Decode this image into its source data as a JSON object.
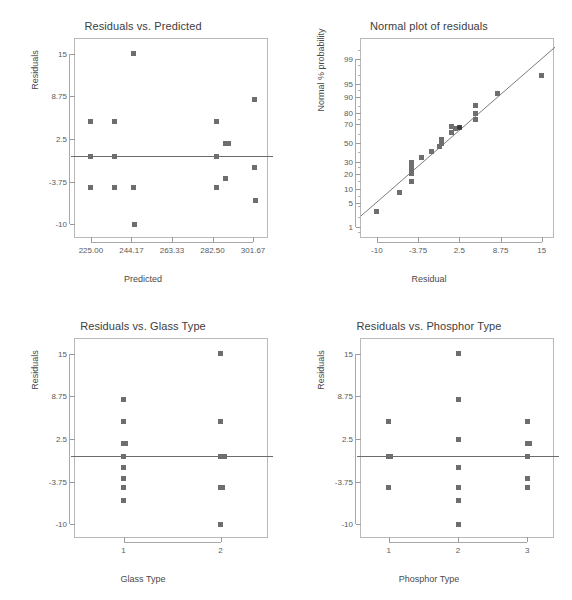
{
  "figure": {
    "marker_color": "#6e6e6e",
    "line_color": "#6b6b6b",
    "frame_color": "#b9b9b9",
    "background": "#ffffff"
  },
  "panels": [
    {
      "id": "residuals-vs-predicted",
      "title": "Residuals vs. Predicted",
      "xlabel": "Predicted",
      "ylabel": "Residuals",
      "xticks": [
        "225.00",
        "244.17",
        "263.33",
        "282.50",
        "301.67"
      ],
      "yticks": [
        "15",
        "8.75",
        "2.5",
        "-3.75",
        "-10"
      ]
    },
    {
      "id": "normal-plot-of-residuals",
      "title": "Normal plot of residuals",
      "xlabel": "Residual",
      "ylabel": "Normal % probability",
      "xticks": [
        "-10",
        "-3.75",
        "2.5",
        "8.75",
        "15"
      ],
      "yticks": [
        "99",
        "95",
        "90",
        "80",
        "70",
        "50",
        "30",
        "20",
        "10",
        "5",
        "1"
      ]
    },
    {
      "id": "residuals-vs-glass-type",
      "title": "Residuals vs. Glass Type",
      "xlabel": "Glass Type",
      "ylabel": "Residuals",
      "xticks": [
        "1",
        "2"
      ],
      "yticks": [
        "15",
        "8.75",
        "2.5",
        "-3.75",
        "-10"
      ]
    },
    {
      "id": "residuals-vs-phosphor-type",
      "title": "Residuals vs. Phosphor Type",
      "xlabel": "Phosphor Type",
      "ylabel": "Residuals",
      "xticks": [
        "1",
        "2",
        "3"
      ],
      "yticks": [
        "15",
        "8.75",
        "2.5",
        "-3.75",
        "-10"
      ]
    }
  ],
  "chart_data": [
    {
      "type": "scatter",
      "id": "residuals-vs-predicted",
      "title": "Residuals vs. Predicted",
      "xlabel": "Predicted",
      "ylabel": "Residuals",
      "xlim": [
        217.5,
        309.2
      ],
      "ylim": [
        -12.2,
        17.2
      ],
      "xticks": [
        225.0,
        244.17,
        263.33,
        282.5,
        301.67
      ],
      "yticks": [
        15,
        8.75,
        2.5,
        -3.75,
        -10
      ],
      "grid": false,
      "reference_line": {
        "orientation": "horizontal",
        "y": 0
      },
      "points": [
        {
          "x": 225.0,
          "y": 5.0
        },
        {
          "x": 225.0,
          "y": 0.0
        },
        {
          "x": 225.0,
          "y": -4.7
        },
        {
          "x": 236.0,
          "y": 5.0
        },
        {
          "x": 236.0,
          "y": 0.0
        },
        {
          "x": 236.0,
          "y": -4.7
        },
        {
          "x": 245.3,
          "y": 15.0
        },
        {
          "x": 245.3,
          "y": -4.7
        },
        {
          "x": 245.7,
          "y": -10.0
        },
        {
          "x": 284.5,
          "y": 5.0
        },
        {
          "x": 284.5,
          "y": 0.0
        },
        {
          "x": 284.5,
          "y": -4.7
        },
        {
          "x": 288.5,
          "y": 1.9
        },
        {
          "x": 290.0,
          "y": 1.9
        },
        {
          "x": 288.8,
          "y": -3.3
        },
        {
          "x": 302.3,
          "y": 8.3
        },
        {
          "x": 302.3,
          "y": -1.7
        },
        {
          "x": 302.6,
          "y": -6.6
        }
      ]
    },
    {
      "type": "scatter",
      "id": "normal-plot-of-residuals",
      "title": "Normal plot of residuals",
      "xlabel": "Residual",
      "ylabel": "Normal % probability",
      "xlim": [
        -12.4,
        17.0
      ],
      "ylim_percent": [
        0.4,
        99.8
      ],
      "xticks": [
        -10,
        -3.75,
        2.5,
        8.75,
        15
      ],
      "yticks_percent": [
        99,
        95,
        90,
        80,
        70,
        50,
        30,
        20,
        10,
        5,
        1
      ],
      "grid": false,
      "reference_line": {
        "orientation": "diagonal",
        "description": "normal reference line"
      },
      "points": [
        {
          "x": -10.0,
          "p": 3.0
        },
        {
          "x": -6.6,
          "p": 8.5
        },
        {
          "x": -4.7,
          "p": 14.5
        },
        {
          "x": -4.7,
          "p": 20.0
        },
        {
          "x": -4.7,
          "p": 23.0
        },
        {
          "x": -4.7,
          "p": 26.5
        },
        {
          "x": -4.7,
          "p": 30.0
        },
        {
          "x": -3.3,
          "p": 34.5
        },
        {
          "x": -1.7,
          "p": 41.0
        },
        {
          "x": -0.5,
          "p": 46.5
        },
        {
          "x": -0.2,
          "p": 50.0
        },
        {
          "x": -0.2,
          "p": 53.5
        },
        {
          "x": 1.3,
          "p": 62.0
        },
        {
          "x": 1.3,
          "p": 68.0
        },
        {
          "x": 1.9,
          "p": 65.5
        },
        {
          "x": 2.5,
          "p": 66.5
        },
        {
          "x": 5.0,
          "p": 74.5
        },
        {
          "x": 5.0,
          "p": 79.5
        },
        {
          "x": 5.0,
          "p": 85.0
        },
        {
          "x": 8.3,
          "p": 91.5
        },
        {
          "x": 15.0,
          "p": 97.0
        }
      ]
    },
    {
      "type": "scatter",
      "id": "residuals-vs-glass-type",
      "title": "Residuals vs. Glass Type",
      "xlabel": "Glass Type",
      "ylabel": "Residuals",
      "xlim": [
        0.5,
        2.5
      ],
      "ylim": [
        -12.2,
        17.2
      ],
      "xticks": [
        1,
        2
      ],
      "yticks": [
        15,
        8.75,
        2.5,
        -3.75,
        -10
      ],
      "grid": false,
      "reference_line": {
        "orientation": "horizontal",
        "y": 0
      },
      "points": [
        {
          "x": 1,
          "y": 8.3
        },
        {
          "x": 1,
          "y": 5.0
        },
        {
          "x": 1,
          "y": 1.9
        },
        {
          "x": 1,
          "y": 1.9
        },
        {
          "x": 1,
          "y": 0.0
        },
        {
          "x": 1,
          "y": -1.7
        },
        {
          "x": 1,
          "y": -3.3
        },
        {
          "x": 1,
          "y": -4.7
        },
        {
          "x": 1,
          "y": -6.6
        },
        {
          "x": 2,
          "y": 15.0
        },
        {
          "x": 2,
          "y": 5.0
        },
        {
          "x": 2,
          "y": 0.0
        },
        {
          "x": 2,
          "y": 0.0
        },
        {
          "x": 2,
          "y": 0.0
        },
        {
          "x": 2,
          "y": -4.7
        },
        {
          "x": 2,
          "y": -4.7
        },
        {
          "x": 2,
          "y": -10.0
        }
      ]
    },
    {
      "type": "scatter",
      "id": "residuals-vs-phosphor-type",
      "title": "Residuals vs. Phosphor Type",
      "xlabel": "Phosphor Type",
      "ylabel": "Residuals",
      "xlim": [
        0.6,
        3.4
      ],
      "ylim": [
        -12.2,
        17.2
      ],
      "xticks": [
        1,
        2,
        3
      ],
      "yticks": [
        15,
        8.75,
        2.5,
        -3.75,
        -10
      ],
      "grid": false,
      "reference_line": {
        "orientation": "horizontal",
        "y": 0
      },
      "points": [
        {
          "x": 1,
          "y": 5.0
        },
        {
          "x": 1,
          "y": 0.0
        },
        {
          "x": 1,
          "y": 0.0
        },
        {
          "x": 1,
          "y": -4.7
        },
        {
          "x": 2,
          "y": 15.0
        },
        {
          "x": 2,
          "y": 8.3
        },
        {
          "x": 2,
          "y": 2.5
        },
        {
          "x": 2,
          "y": -1.7
        },
        {
          "x": 2,
          "y": -4.7
        },
        {
          "x": 2,
          "y": -6.6
        },
        {
          "x": 2,
          "y": -10.0
        },
        {
          "x": 3,
          "y": 5.0
        },
        {
          "x": 3,
          "y": 1.9
        },
        {
          "x": 3,
          "y": 1.9
        },
        {
          "x": 3,
          "y": 0.0
        },
        {
          "x": 3,
          "y": -3.3
        },
        {
          "x": 3,
          "y": -4.7
        }
      ]
    }
  ]
}
